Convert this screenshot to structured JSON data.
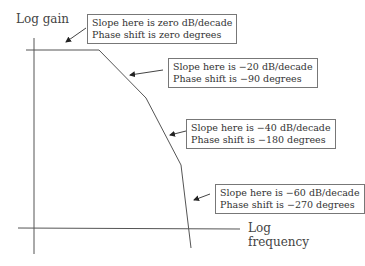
{
  "axes": {
    "y_label": "Log gain",
    "x_label_line1": "Log",
    "x_label_line2": "frequency"
  },
  "annotations": [
    {
      "slope": "Slope here is zero dB/decade",
      "phase": "Phase shift is zero degrees"
    },
    {
      "slope": "Slope here is −20 dB/decade",
      "phase": "Phase shift is −90 degrees"
    },
    {
      "slope": "Slope here is −40 dB/decade",
      "phase": "Phase shift is −180 degrees"
    },
    {
      "slope": "Slope here is −60 dB/decade",
      "phase": "Phase shift is −270 degrees"
    }
  ],
  "colors": {
    "line": "#555555",
    "border": "#777777"
  }
}
